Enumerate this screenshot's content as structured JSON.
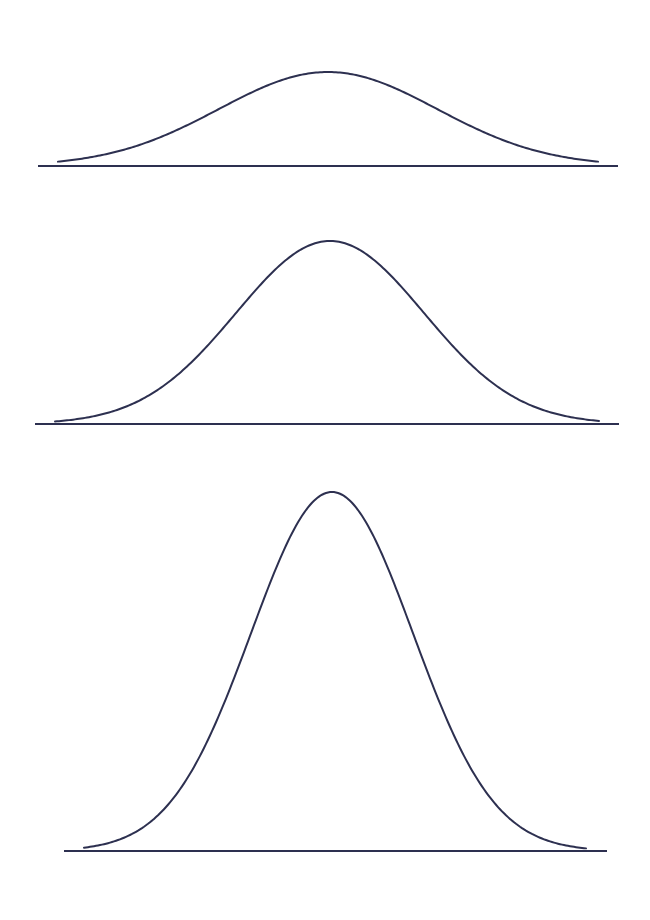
{
  "page": {
    "width": 650,
    "height": 920,
    "background": "#ffffff",
    "stroke_color": "#2d3050",
    "stroke_width": 2
  },
  "chart_data": [
    {
      "type": "line",
      "title": "",
      "description": "Bell-shaped (normal) curve, low and wide",
      "xlabel": "",
      "ylabel": "",
      "grid": false,
      "baseline": {
        "x1": 38,
        "x2": 618,
        "y": 166
      },
      "peak": {
        "x": 328,
        "y": 72
      },
      "amplitude_px": 94,
      "sigma_px": 109
    },
    {
      "type": "line",
      "title": "",
      "description": "Bell-shaped (normal) curve, medium height",
      "xlabel": "",
      "ylabel": "",
      "grid": false,
      "baseline": {
        "x1": 35,
        "x2": 619,
        "y": 424
      },
      "peak": {
        "x": 330,
        "y": 241
      },
      "amplitude_px": 183,
      "sigma_px": 94
    },
    {
      "type": "line",
      "title": "",
      "description": "Bell-shaped (normal) curve, tall and narrow",
      "xlabel": "",
      "ylabel": "",
      "grid": false,
      "baseline": {
        "x1": 64,
        "x2": 607,
        "y": 851
      },
      "peak": {
        "x": 332,
        "y": 492
      },
      "amplitude_px": 359,
      "sigma_px": 81
    }
  ]
}
